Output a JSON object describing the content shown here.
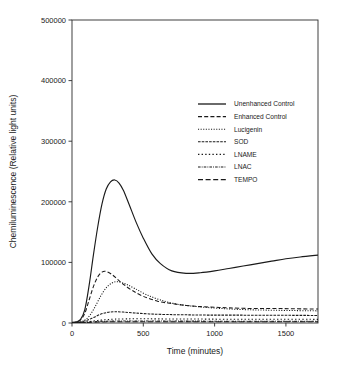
{
  "chart_data": {
    "type": "line",
    "title": "",
    "xlabel": "Time (minutes)",
    "ylabel": "Chemiluminescence (Relative light units)",
    "xlim": [
      0,
      1725
    ],
    "ylim": [
      0,
      500000
    ],
    "xticks": [
      0,
      500,
      1000,
      1500
    ],
    "xtick_labels": [
      "0",
      "500",
      "1000",
      "1500"
    ],
    "yticks": [
      0,
      100000,
      200000,
      300000,
      400000,
      500000
    ],
    "ytick_labels": [
      "0",
      "100000",
      "200000",
      "300000",
      "400000",
      "500000"
    ],
    "grid": false,
    "legend_position": "upper center",
    "series": [
      {
        "name": "Unenhanced Control",
        "style": "solid",
        "x": [
          0,
          30,
          60,
          90,
          120,
          150,
          180,
          210,
          240,
          270,
          300,
          330,
          360,
          400,
          450,
          500,
          560,
          620,
          700,
          800,
          900,
          1000,
          1100,
          1200,
          1300,
          1400,
          1500,
          1600,
          1725
        ],
        "values": [
          1000,
          2000,
          6000,
          22000,
          62000,
          112000,
          158000,
          196000,
          221000,
          233000,
          236000,
          231000,
          219000,
          196000,
          166000,
          140000,
          114000,
          98000,
          86000,
          82000,
          83000,
          86000,
          90000,
          94000,
          98000,
          102000,
          106000,
          109000,
          112000
        ]
      },
      {
        "name": "Enhanced Control",
        "style": "dashed",
        "x": [
          0,
          30,
          60,
          90,
          120,
          150,
          180,
          210,
          240,
          280,
          320,
          360,
          420,
          500,
          600,
          700,
          800,
          900,
          1000,
          1100,
          1250,
          1400,
          1550,
          1725
        ],
        "values": [
          500,
          1500,
          5000,
          16000,
          38000,
          60000,
          76000,
          84000,
          85000,
          80000,
          72000,
          64000,
          54000,
          44000,
          36000,
          32000,
          29000,
          27000,
          26000,
          25000,
          24000,
          24000,
          23500,
          23000
        ]
      },
      {
        "name": "Lucigenin",
        "style": "fine-dotted",
        "x": [
          0,
          40,
          80,
          120,
          160,
          200,
          240,
          280,
          320,
          380,
          440,
          520,
          620,
          740,
          880,
          1040,
          1220,
          1420,
          1725
        ],
        "values": [
          300,
          1000,
          3500,
          11000,
          26000,
          44000,
          58000,
          66000,
          68000,
          64000,
          57000,
          47000,
          38000,
          31000,
          27000,
          24000,
          22000,
          21000,
          20000
        ]
      },
      {
        "name": "SOD",
        "style": "dash-dot-dense",
        "x": [
          0,
          50,
          100,
          150,
          200,
          250,
          300,
          360,
          440,
          540,
          660,
          800,
          960,
          1140,
          1340,
          1560,
          1725
        ],
        "values": [
          300,
          1200,
          4000,
          9000,
          14500,
          17500,
          18500,
          18000,
          16500,
          15000,
          14000,
          13500,
          13000,
          13000,
          12800,
          12600,
          12500
        ]
      },
      {
        "name": "LNAME",
        "style": "dotted",
        "x": [
          0,
          60,
          120,
          180,
          240,
          300,
          380,
          480,
          600,
          760,
          960,
          1200,
          1460,
          1725
        ],
        "values": [
          200,
          800,
          2400,
          4200,
          5600,
          6400,
          6800,
          6900,
          6800,
          6600,
          6400,
          6200,
          6100,
          6000
        ]
      },
      {
        "name": "LNAC",
        "style": "dash-dot-dot",
        "x": [
          0,
          80,
          160,
          240,
          340,
          460,
          620,
          820,
          1060,
          1340,
          1725
        ],
        "values": [
          200,
          900,
          2200,
          3000,
          3300,
          3300,
          3200,
          3100,
          3000,
          3000,
          2900
        ]
      },
      {
        "name": "TEMPO",
        "style": "long-dash",
        "x": [
          0,
          80,
          180,
          300,
          460,
          660,
          900,
          1180,
          1460,
          1725
        ],
        "values": [
          150,
          700,
          1600,
          2100,
          2200,
          2100,
          2000,
          2000,
          1950,
          1900
        ]
      }
    ]
  },
  "colors": {
    "axis": "#2b2b2b",
    "line": "#1a1a1a",
    "background": "#ffffff"
  }
}
